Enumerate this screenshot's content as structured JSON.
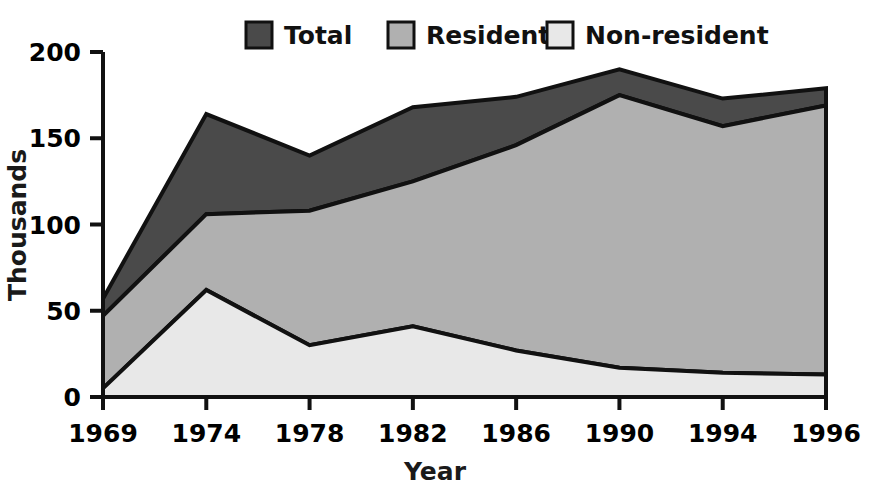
{
  "chart_data": {
    "type": "area",
    "title": "",
    "subtitle": "",
    "xlabel": "Year",
    "ylabel": "Thousands",
    "categories": [
      "1969",
      "1974",
      "1978",
      "1982",
      "1986",
      "1990",
      "1994",
      "1996"
    ],
    "x": [
      1969,
      1974,
      1978,
      1982,
      1986,
      1990,
      1994,
      1996
    ],
    "stacked": true,
    "grid": false,
    "legend_position": "top-center",
    "ylim": [
      0,
      200
    ],
    "yticks": [
      0,
      50,
      100,
      150,
      200
    ],
    "ytick_labels": [
      "0",
      "50",
      "100",
      "150",
      "200"
    ],
    "xtick_labels": [
      "1969",
      "1974",
      "1978",
      "1982",
      "1986",
      "1990",
      "1994",
      "1996"
    ],
    "series": [
      {
        "name": "Non-resident",
        "color": "#e8e8e8",
        "values": [
          5,
          62,
          30,
          41,
          27,
          17,
          14,
          13
        ]
      },
      {
        "name": "Resident",
        "color": "#b0b0b0",
        "values": [
          42,
          44,
          78,
          84,
          119,
          158,
          143,
          156
        ]
      },
      {
        "name": "Total",
        "color": "#4a4a4a",
        "values": [
          10,
          58,
          32,
          43,
          28,
          15,
          16,
          10
        ]
      }
    ],
    "cumulative_boundaries": {
      "non_resident_top": [
        5,
        62,
        30,
        41,
        27,
        17,
        14,
        13
      ],
      "resident_top": [
        47,
        106,
        108,
        125,
        146,
        175,
        157,
        169
      ],
      "total_top": [
        57,
        164,
        140,
        168,
        174,
        190,
        173,
        179
      ]
    },
    "annotations": []
  },
  "legend": {
    "items": [
      {
        "label": "Total",
        "color": "#4a4a4a"
      },
      {
        "label": "Resident",
        "color": "#b0b0b0"
      },
      {
        "label": "Non-resident",
        "color": "#e8e8e8"
      }
    ]
  },
  "axes": {
    "y_title": "Thousands",
    "x_title": "Year",
    "y_ticks": [
      "200",
      "150",
      "100",
      "50",
      "0"
    ],
    "x_ticks": [
      "1969",
      "1974",
      "1978",
      "1982",
      "1986",
      "1990",
      "1994",
      "1996"
    ]
  },
  "colors": {
    "total": "#4a4a4a",
    "resident": "#b0b0b0",
    "non_resident": "#e8e8e8",
    "outline": "#111111",
    "text": "#000000",
    "background": "#ffffff"
  }
}
